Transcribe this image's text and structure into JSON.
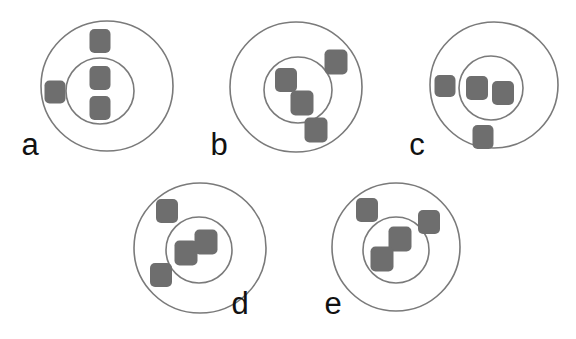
{
  "figure": {
    "background_color": "#ffffff",
    "width": 576,
    "height": 339,
    "style": {
      "circle_stroke_color": "#7a7a7a",
      "circle_stroke_width": 1.6,
      "circle_fill": "#ffffff",
      "marker_color": "#6e6e6e",
      "marker_corner_radius": 5,
      "label_color": "#111111",
      "label_font_size": 31
    },
    "panels": [
      {
        "id": "panel-a",
        "label": "a",
        "label_x": 30,
        "label_y": 155,
        "outer": {
          "cx": 107,
          "cy": 86,
          "rx": 66,
          "ry": 65
        },
        "inner": {
          "cx": 100,
          "cy": 91,
          "rx": 34,
          "ry": 33
        },
        "markers": [
          {
            "id": "a-1",
            "x": 100,
            "y": 41,
            "w": 21,
            "h": 24,
            "location": "between-circles"
          },
          {
            "id": "a-2",
            "x": 100,
            "y": 78,
            "w": 21,
            "h": 24,
            "location": "inner"
          },
          {
            "id": "a-3",
            "x": 100,
            "y": 108,
            "w": 21,
            "h": 24,
            "location": "inner"
          },
          {
            "id": "a-4",
            "x": 55,
            "y": 92,
            "w": 21,
            "h": 23,
            "location": "between-circles"
          }
        ]
      },
      {
        "id": "panel-b",
        "label": "b",
        "label_x": 219,
        "label_y": 155,
        "outer": {
          "cx": 296,
          "cy": 87,
          "rx": 66,
          "ry": 65
        },
        "inner": {
          "cx": 298,
          "cy": 90,
          "rx": 34,
          "ry": 33
        },
        "markers": [
          {
            "id": "b-1",
            "x": 286,
            "y": 80,
            "w": 22,
            "h": 24,
            "location": "inner"
          },
          {
            "id": "b-2",
            "x": 302,
            "y": 103,
            "w": 23,
            "h": 25,
            "location": "inner"
          },
          {
            "id": "b-3",
            "x": 336,
            "y": 62,
            "w": 23,
            "h": 25,
            "location": "between-circles"
          },
          {
            "id": "b-4",
            "x": 316,
            "y": 130,
            "w": 23,
            "h": 25,
            "location": "between-circles"
          }
        ]
      },
      {
        "id": "panel-c",
        "label": "c",
        "label_x": 417,
        "label_y": 155,
        "outer": {
          "cx": 494,
          "cy": 85,
          "rx": 64,
          "ry": 63
        },
        "inner": {
          "cx": 491,
          "cy": 88,
          "rx": 32,
          "ry": 32
        },
        "markers": [
          {
            "id": "c-1",
            "x": 477,
            "y": 88,
            "w": 22,
            "h": 24,
            "location": "inner"
          },
          {
            "id": "c-2",
            "x": 503,
            "y": 93,
            "w": 22,
            "h": 24,
            "location": "inner"
          },
          {
            "id": "c-3",
            "x": 445,
            "y": 86,
            "w": 21,
            "h": 22,
            "location": "between-circles"
          },
          {
            "id": "c-4",
            "x": 483,
            "y": 137,
            "w": 21,
            "h": 24,
            "location": "between-circles"
          }
        ]
      },
      {
        "id": "panel-d",
        "label": "d",
        "label_x": 240,
        "label_y": 314,
        "outer": {
          "cx": 200,
          "cy": 248,
          "rx": 66,
          "ry": 65
        },
        "inner": {
          "cx": 199,
          "cy": 250,
          "rx": 33,
          "ry": 33
        },
        "markers": [
          {
            "id": "d-1",
            "x": 167,
            "y": 211,
            "w": 22,
            "h": 24,
            "location": "between-circles"
          },
          {
            "id": "d-2",
            "x": 161,
            "y": 275,
            "w": 22,
            "h": 24,
            "location": "between-circles"
          },
          {
            "id": "d-3",
            "x": 186,
            "y": 253,
            "w": 23,
            "h": 25,
            "location": "inner"
          },
          {
            "id": "d-4",
            "x": 206,
            "y": 242,
            "w": 23,
            "h": 25,
            "location": "inner"
          }
        ]
      },
      {
        "id": "panel-e",
        "label": "e",
        "label_x": 333,
        "label_y": 314,
        "outer": {
          "cx": 396,
          "cy": 247,
          "rx": 64,
          "ry": 64
        },
        "inner": {
          "cx": 396,
          "cy": 250,
          "rx": 33,
          "ry": 33
        },
        "markers": [
          {
            "id": "e-1",
            "x": 367,
            "y": 210,
            "w": 22,
            "h": 24,
            "location": "between-circles"
          },
          {
            "id": "e-2",
            "x": 429,
            "y": 222,
            "w": 22,
            "h": 24,
            "location": "between-circles"
          },
          {
            "id": "e-3",
            "x": 400,
            "y": 239,
            "w": 23,
            "h": 25,
            "location": "inner"
          },
          {
            "id": "e-4",
            "x": 382,
            "y": 259,
            "w": 23,
            "h": 25,
            "location": "inner"
          }
        ]
      }
    ]
  }
}
